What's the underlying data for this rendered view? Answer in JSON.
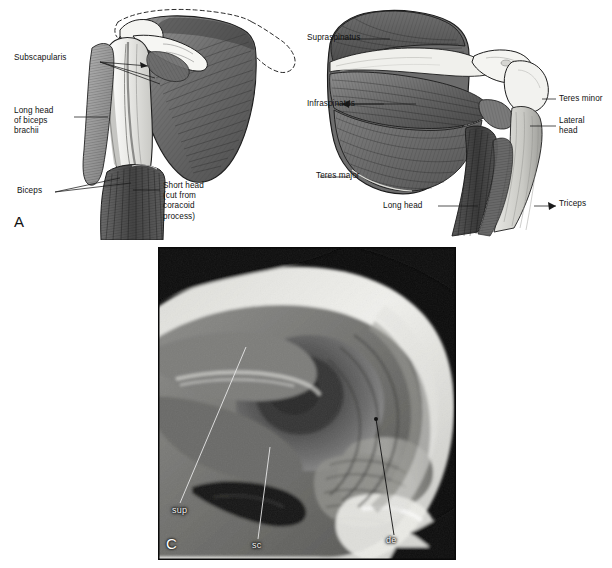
{
  "figure": {
    "background_color": "#ffffff",
    "panel_letters": {
      "a": "A",
      "b": "B",
      "c": "C"
    }
  },
  "panel_a": {
    "letter": "A",
    "view": "anterior",
    "labels": [
      {
        "id": "subscapularis",
        "text": "Subscapularis",
        "lines": [
          "Subscapularis"
        ],
        "x": 14,
        "y": 57,
        "align": "left"
      },
      {
        "id": "long-head-biceps",
        "text": "Long head of biceps brachii",
        "lines": [
          "Long head",
          "of biceps",
          "brachii"
        ],
        "x": 14,
        "y": 110,
        "align": "left"
      },
      {
        "id": "biceps",
        "text": "Biceps",
        "lines": [
          "Biceps"
        ],
        "x": 17,
        "y": 189,
        "align": "left"
      },
      {
        "id": "short-head",
        "text": "Short head (cut from coracoid process)",
        "lines": [
          "Short head",
          "(cut from",
          "coracoid",
          "process)"
        ],
        "x": 163,
        "y": 184,
        "align": "left"
      }
    ]
  },
  "panel_b": {
    "letter": "B",
    "view": "posterior",
    "labels": [
      {
        "id": "supraspinatus",
        "text": "Supraspinatus",
        "lines": [
          "Supraspinatus"
        ],
        "x": 307,
        "y": 35,
        "align": "left"
      },
      {
        "id": "infraspinatus",
        "text": "Infraspinatus",
        "lines": [
          "Infraspinatus"
        ],
        "x": 307,
        "y": 101,
        "align": "left"
      },
      {
        "id": "teres-minor",
        "text": "Teres minor",
        "lines": [
          "Teres minor"
        ],
        "x": 555,
        "y": 96,
        "align": "left"
      },
      {
        "id": "lateral-head",
        "text": "Lateral head",
        "lines": [
          "Lateral",
          "head"
        ],
        "x": 555,
        "y": 118,
        "align": "left"
      },
      {
        "id": "teres-major",
        "text": "Teres major",
        "lines": [
          "Teres major"
        ],
        "x": 318,
        "y": 173,
        "align": "left"
      },
      {
        "id": "long-head",
        "text": "Long head",
        "lines": [
          "Long head"
        ],
        "x": 383,
        "y": 203,
        "align": "left"
      },
      {
        "id": "triceps",
        "text": "Triceps",
        "lines": [
          "Triceps"
        ],
        "x": 555,
        "y": 201,
        "align": "left"
      }
    ]
  },
  "panel_c": {
    "letter": "C",
    "modality": "MRI",
    "frame": {
      "x": 158,
      "y": 247,
      "width": 298,
      "height": 313
    },
    "labels": [
      {
        "id": "supraspinatus-mri",
        "text": "sup",
        "x": 172,
        "y": 508
      },
      {
        "id": "subscapularis-mri",
        "text": "sc",
        "x": 252,
        "y": 543
      },
      {
        "id": "deltoid-mri",
        "text": "de",
        "x": 386,
        "y": 538
      }
    ]
  },
  "colors": {
    "background": "#ffffff",
    "ink": "#1a1a1a",
    "label_text": "#111111",
    "mri_label_text": "#f2f2f2",
    "muscle_light": "#b9b9b9",
    "muscle_mid": "#8a8a8a",
    "muscle_dark": "#4a4a4a",
    "bone_light": "#f2f2f0",
    "mri_dark": "#0a0a0a",
    "mri_fat_bright": "#f0f0ee"
  }
}
